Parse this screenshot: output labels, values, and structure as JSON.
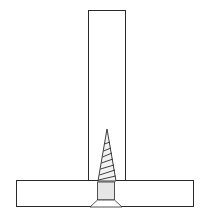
{
  "diagram": {
    "description": "Screw joining a vertical board to a horizontal board (countersunk from below)",
    "colors": {
      "line": "#2a2a2a",
      "background": "#ffffff",
      "screw_fill": "#e6e6e6"
    },
    "vertical_board": {
      "x": 88,
      "y": 10,
      "width": 38,
      "height": 170
    },
    "horizontal_board": {
      "x": 16,
      "y": 180,
      "width": 178,
      "height": 27
    },
    "screw": {
      "tip": [
        107,
        129
      ],
      "thread_base_left": [
        98,
        180
      ],
      "thread_base_right": [
        116,
        180
      ],
      "shank": {
        "x": 97,
        "y": 182,
        "width": 18,
        "height": 18
      },
      "head": {
        "top_left": [
          97,
          200
        ],
        "top_right": [
          115,
          200
        ],
        "bottom_left": [
          89,
          207
        ],
        "bottom_right": [
          123,
          207
        ]
      },
      "thread_count": 7
    }
  }
}
